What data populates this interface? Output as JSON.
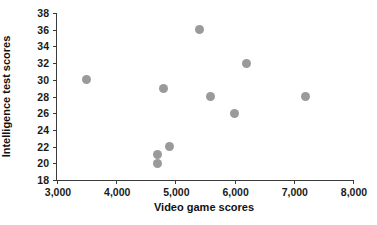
{
  "chart_data": {
    "type": "scatter",
    "title": "",
    "xlabel": "Video game scores",
    "ylabel": "Intelligence test scores",
    "xlim": [
      3000,
      8000
    ],
    "ylim": [
      18,
      38
    ],
    "xticks": [
      3000,
      4000,
      5000,
      6000,
      7000,
      8000
    ],
    "xtick_labels": [
      "3,000",
      "4,000",
      "5,000",
      "6,000",
      "7,000",
      "8,000"
    ],
    "yticks": [
      18,
      20,
      22,
      24,
      26,
      28,
      30,
      32,
      34,
      36,
      38
    ],
    "ytick_labels": [
      "18",
      "20",
      "22",
      "24",
      "26",
      "28",
      "30",
      "32",
      "34",
      "36",
      "38"
    ],
    "grid": false,
    "legend": false,
    "marker_color": "#9a9a9a",
    "marker_shape": "circle",
    "axis_color": "#3a3a3a",
    "points": [
      {
        "x": 3500,
        "y": 30
      },
      {
        "x": 4700,
        "y": 21
      },
      {
        "x": 4700,
        "y": 20
      },
      {
        "x": 4800,
        "y": 29
      },
      {
        "x": 4900,
        "y": 22
      },
      {
        "x": 5400,
        "y": 36
      },
      {
        "x": 5600,
        "y": 28
      },
      {
        "x": 6000,
        "y": 26
      },
      {
        "x": 6200,
        "y": 32
      },
      {
        "x": 7200,
        "y": 28
      }
    ]
  }
}
